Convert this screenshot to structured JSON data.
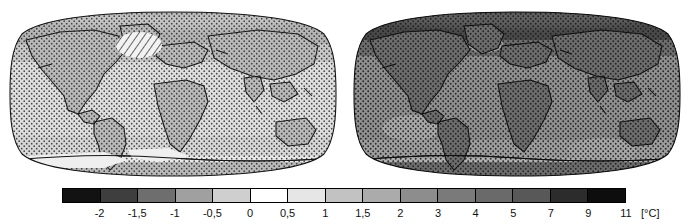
{
  "figure": {
    "type": "climate-anomaly-map-pair",
    "projection": "Robinson",
    "colormap": "grayscale-diverging",
    "background": "#ffffff"
  },
  "panels": [
    {
      "id": "left",
      "name": "map-left",
      "description": "Global surface temperature change map, near-term period (lighter = smaller warming)",
      "base_shade": "#d8d8d8",
      "overlay": "stipple",
      "hatching": true,
      "hatch_region": "north-atlantic-greenland",
      "land_shade": "#bdbdbd",
      "ocean_shade": "#dcdcdc"
    },
    {
      "id": "right",
      "name": "map-right",
      "description": "Global surface temperature change map, long-term period (darker = larger warming)",
      "base_shade": "#8a8a8a",
      "overlay": "stipple",
      "hatching": false,
      "land_shade": "#777777",
      "ocean_shade": "#909090"
    }
  ],
  "colorbar": {
    "name": "temperature-colorbar",
    "unit_label": "[°C]",
    "orientation": "horizontal",
    "tick_labels": [
      "-2",
      "-1,5",
      "-1",
      "-0,5",
      "0",
      "0,5",
      "1",
      "1,5",
      "2",
      "3",
      "4",
      "5",
      "7",
      "9",
      "11"
    ],
    "segment_colors": [
      "#121212",
      "#3e3e3e",
      "#6e6e6e",
      "#a0a0a0",
      "#cfcfcf",
      "#ffffff",
      "#e6e6e6",
      "#c2c2c2",
      "#ababab",
      "#8d8d8d",
      "#7a7a7a",
      "#6a6a6a",
      "#585858",
      "#2c2c2c",
      "#0d0d0d"
    ]
  },
  "chart_data": {
    "type": "heatmap",
    "title": "",
    "subtitle": "",
    "xlabel": "",
    "ylabel": "",
    "colorbar_label": "[°C]",
    "colorbar_ticks": [
      -2,
      -1.5,
      -1,
      -0.5,
      0,
      0.5,
      1,
      1.5,
      2,
      3,
      4,
      5,
      7,
      9,
      11
    ],
    "colorbar_tick_labels": [
      "-2",
      "-1,5",
      "-1",
      "-0,5",
      "0",
      "0,5",
      "1",
      "1,5",
      "2",
      "3",
      "4",
      "5",
      "7",
      "9",
      "11"
    ],
    "colorbar_range": [
      -2,
      11
    ],
    "legend_position": "bottom",
    "grid": false,
    "panels": [
      {
        "name": "left",
        "regions": [
          {
            "region": "Arctic / northern high latitudes",
            "value": 2.0
          },
          {
            "region": "North America",
            "value": 1.5
          },
          {
            "region": "North Atlantic (hatched, low confidence)",
            "value": 0.0
          },
          {
            "region": "Europe",
            "value": 1.5
          },
          {
            "region": "Asia interior",
            "value": 1.5
          },
          {
            "region": "Africa",
            "value": 1.5
          },
          {
            "region": "South America",
            "value": 1.0
          },
          {
            "region": "Australia",
            "value": 1.0
          },
          {
            "region": "Tropical oceans",
            "value": 0.5
          },
          {
            "region": "Southern Ocean",
            "value": 0.5
          },
          {
            "region": "Antarctica",
            "value": 0.5
          }
        ]
      },
      {
        "name": "right",
        "regions": [
          {
            "region": "Arctic / northern high latitudes",
            "value": 9.0
          },
          {
            "region": "North America",
            "value": 5.0
          },
          {
            "region": "North Atlantic",
            "value": 2.0
          },
          {
            "region": "Europe",
            "value": 5.0
          },
          {
            "region": "Asia interior",
            "value": 5.0
          },
          {
            "region": "Africa",
            "value": 4.0
          },
          {
            "region": "South America",
            "value": 4.0
          },
          {
            "region": "Australia",
            "value": 4.0
          },
          {
            "region": "Tropical oceans",
            "value": 3.0
          },
          {
            "region": "Southern Ocean",
            "value": 2.0
          },
          {
            "region": "Antarctica",
            "value": 3.0
          }
        ]
      }
    ]
  }
}
